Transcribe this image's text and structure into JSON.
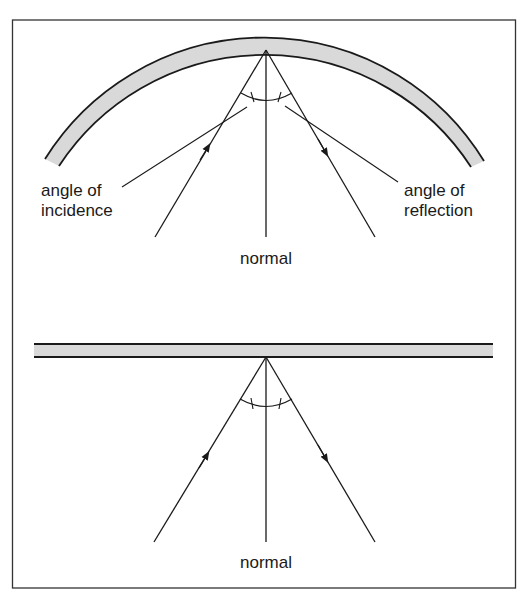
{
  "diagram": {
    "type": "ray-reflection",
    "colors": {
      "line": "#1a1a1a",
      "mirror_fill": "#d9d9d9",
      "frame": "#333333",
      "background": "#ffffff"
    },
    "curved_panel": {
      "mirror_shape": "curved",
      "labels": {
        "incidence_line1": "angle of",
        "incidence_line2": "incidence",
        "reflection_line1": "angle of",
        "reflection_line2": "reflection",
        "normal": "normal"
      }
    },
    "flat_panel": {
      "mirror_shape": "flat",
      "labels": {
        "normal": "normal"
      }
    }
  }
}
